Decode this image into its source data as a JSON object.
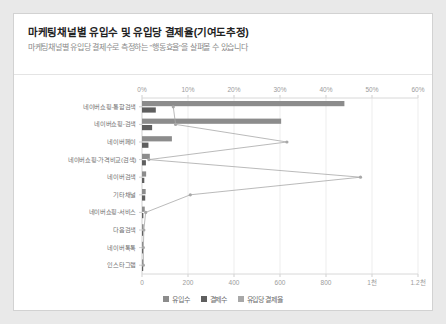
{
  "card": {
    "title": "마케팅채널별 유입수 및 유입당 결제율(기여도추정)",
    "subtitle": "마케팅채널별 유입당 결제수로 측정하는 \"행동효율\"을 살펴볼 수 있습니다"
  },
  "legend": {
    "items": [
      {
        "label": "유입수",
        "color": "#8c8c8c"
      },
      {
        "label": "결제수",
        "color": "#5f5f5f"
      },
      {
        "label": "유입당 결제율",
        "color": "#a8a8a8"
      }
    ]
  },
  "chart_data": {
    "type": "bar",
    "title": "마케팅채널별 유입수 및 유입당 결제율(기여도추정)",
    "orientation": "horizontal",
    "xlabel": "",
    "ylabel": "",
    "grid": true,
    "legend_position": "bottom",
    "categories": [
      "네이버쇼핑-통합검색",
      "네이버쇼핑-검색",
      "네이버페이",
      "네이버쇼핑-가격비교(검색)",
      "네이버검색",
      "기타채널",
      "네이버쇼핑-서비스",
      "다음검색",
      "네이버톡톡",
      "인스타그램"
    ],
    "bottom_axis": {
      "name": "건수",
      "ticks": [
        "0",
        "200",
        "400",
        "600",
        "800",
        "1천",
        "1.2천"
      ],
      "tick_values": [
        0,
        200,
        400,
        600,
        800,
        1000,
        1200
      ],
      "range": [
        0,
        1200
      ]
    },
    "top_axis": {
      "name": "유입당 결제율",
      "ticks": [
        "0%",
        "10%",
        "20%",
        "30%",
        "40%",
        "50%",
        "60%"
      ],
      "tick_values": [
        0,
        10,
        20,
        30,
        40,
        50,
        60
      ],
      "range": [
        0,
        60
      ]
    },
    "series": [
      {
        "name": "유입수",
        "type": "bar",
        "axis": "bottom",
        "color": "#8c8c8c",
        "values": [
          880,
          605,
          130,
          34,
          18,
          16,
          12,
          7,
          5,
          4
        ]
      },
      {
        "name": "결제수",
        "type": "bar",
        "axis": "bottom",
        "color": "#5f5f5f",
        "values": [
          60,
          44,
          28,
          17,
          10,
          14,
          6,
          3,
          2,
          2
        ]
      },
      {
        "name": "유입당 결제율",
        "type": "line",
        "axis": "top",
        "color": "#a8a8a8",
        "values": [
          6.8,
          7.3,
          31.5,
          1.5,
          47.5,
          10.5,
          0.8,
          0.4,
          0.3,
          0.3
        ]
      }
    ]
  }
}
